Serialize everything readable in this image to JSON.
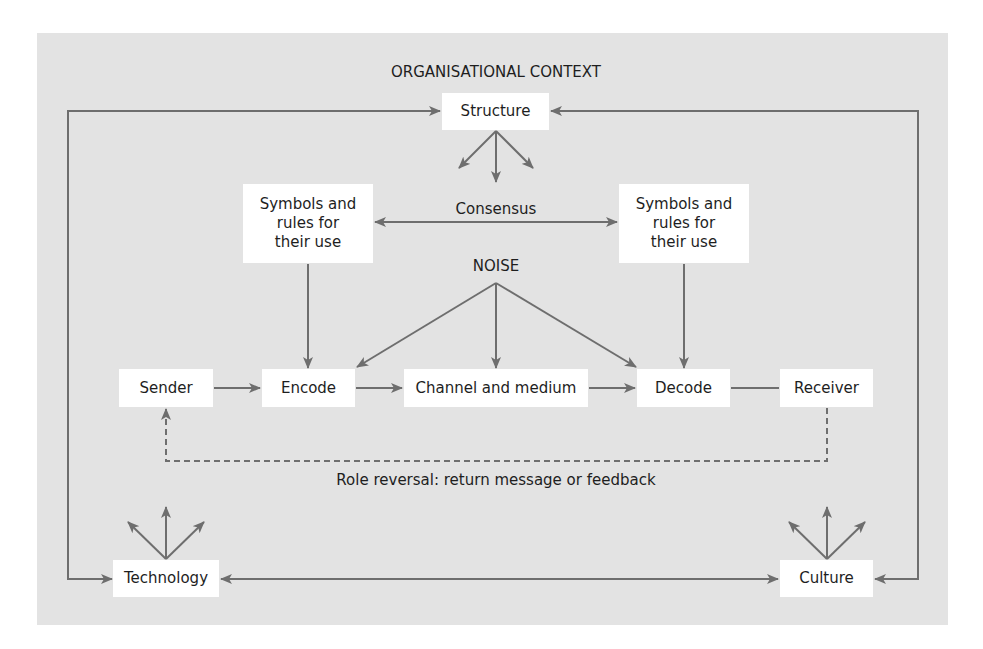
{
  "diagram": {
    "title": "ORGANISATIONAL CONTEXT",
    "noise_label": "NOISE",
    "consensus_label": "Consensus",
    "feedback_label": "Role reversal: return message or feedback",
    "nodes": {
      "structure": "Structure",
      "symbols_left": "Symbols and\nrules for\ntheir use",
      "symbols_right": "Symbols and\nrules for\ntheir use",
      "sender": "Sender",
      "encode": "Encode",
      "channel": "Channel and medium",
      "decode": "Decode",
      "receiver": "Receiver",
      "technology": "Technology",
      "culture": "Culture"
    },
    "edges": [
      {
        "from": "sender",
        "to": "encode",
        "style": "arrow"
      },
      {
        "from": "encode",
        "to": "channel",
        "style": "arrow"
      },
      {
        "from": "channel",
        "to": "decode",
        "style": "arrow"
      },
      {
        "from": "decode",
        "to": "receiver",
        "style": "line"
      },
      {
        "from": "receiver",
        "to": "sender",
        "style": "dashed-arrow",
        "label": "Role reversal: return message or feedback"
      },
      {
        "from": "symbols_left",
        "to": "encode",
        "style": "arrow"
      },
      {
        "from": "symbols_right",
        "to": "decode",
        "style": "arrow"
      },
      {
        "from": "symbols_left",
        "to": "symbols_right",
        "style": "double-arrow",
        "label": "Consensus"
      },
      {
        "from": "noise",
        "to": "encode",
        "style": "arrow"
      },
      {
        "from": "noise",
        "to": "channel",
        "style": "arrow"
      },
      {
        "from": "noise",
        "to": "decode",
        "style": "arrow"
      },
      {
        "from": "technology",
        "to": "culture",
        "style": "double-arrow"
      },
      {
        "from": "technology",
        "to": "structure",
        "style": "arrow"
      },
      {
        "from": "culture",
        "to": "structure",
        "style": "arrow"
      },
      {
        "from": "structure",
        "to": "technology",
        "style": "arrow"
      },
      {
        "from": "structure",
        "to": "culture",
        "style": "arrow"
      }
    ],
    "colors": {
      "background": "#e3e3e3",
      "box": "#ffffff",
      "line": "#6e6e6e",
      "text": "#1e1e1e"
    }
  }
}
